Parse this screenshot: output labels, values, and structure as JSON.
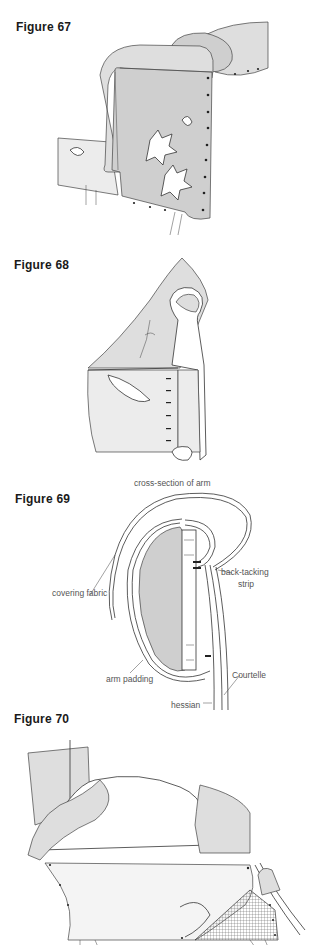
{
  "figures": [
    {
      "id": "figure-67",
      "title": "Figure 67",
      "labels": []
    },
    {
      "id": "figure-68",
      "title": "Figure 68",
      "labels": []
    },
    {
      "id": "figure-69",
      "title": "Figure 69",
      "labels": [
        {
          "text": "cross-section of arm"
        },
        {
          "text": "covering fabric"
        },
        {
          "text": "back-tacking"
        },
        {
          "text": "strip"
        },
        {
          "text": "arm padding"
        },
        {
          "text": "Courtelle"
        },
        {
          "text": "hessian"
        }
      ]
    },
    {
      "id": "figure-70",
      "title": "Figure 70",
      "labels": []
    }
  ]
}
